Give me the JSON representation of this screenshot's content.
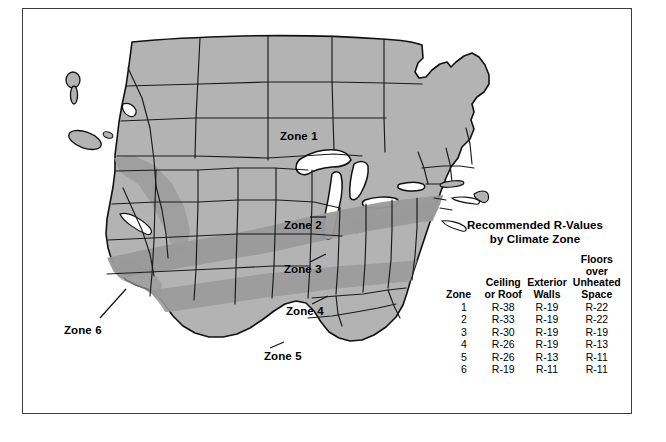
{
  "figure": {
    "frame_color": "#3c3c3c",
    "background": "#ffffff"
  },
  "map": {
    "name": "united-states-climate-zone-map",
    "land_fill": "#b3b3b3",
    "band_fill": "#949494",
    "water_fill": "#ffffff",
    "outline_color": "#111111",
    "state_border_color": "#1a1a1a",
    "zone_labels": [
      {
        "id": "zone-1",
        "text": "Zone 1"
      },
      {
        "id": "zone-2",
        "text": "Zone 2"
      },
      {
        "id": "zone-3",
        "text": "Zone 3"
      },
      {
        "id": "zone-4",
        "text": "Zone 4"
      },
      {
        "id": "zone-5",
        "text": "Zone 5"
      },
      {
        "id": "zone-6",
        "text": "Zone 6"
      }
    ]
  },
  "legend": {
    "title_line1": "Recommended R-Values",
    "title_line2": "by Climate Zone",
    "columns": [
      {
        "key": "zone",
        "header_lines": [
          "",
          "Zone"
        ]
      },
      {
        "key": "ceiling",
        "header_lines": [
          "Ceiling",
          "or Roof"
        ]
      },
      {
        "key": "walls",
        "header_lines": [
          "Exterior",
          "Walls"
        ]
      },
      {
        "key": "floors",
        "header_lines": [
          "Floors",
          "over",
          "Unheated",
          "Space"
        ]
      }
    ],
    "rows": [
      {
        "zone": "1",
        "ceiling": "R-38",
        "walls": "R-19",
        "floors": "R-22"
      },
      {
        "zone": "2",
        "ceiling": "R-33",
        "walls": "R-19",
        "floors": "R-22"
      },
      {
        "zone": "3",
        "ceiling": "R-30",
        "walls": "R-19",
        "floors": "R-19"
      },
      {
        "zone": "4",
        "ceiling": "R-26",
        "walls": "R-19",
        "floors": "R-13"
      },
      {
        "zone": "5",
        "ceiling": "R-26",
        "walls": "R-13",
        "floors": "R-11"
      },
      {
        "zone": "6",
        "ceiling": "R-19",
        "walls": "R-11",
        "floors": "R-11"
      }
    ]
  }
}
